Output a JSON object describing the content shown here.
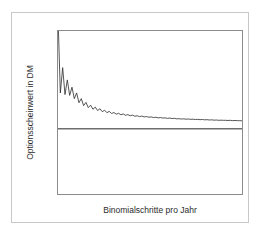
{
  "chart_data": {
    "type": "line",
    "title": "",
    "xlabel": "Binomialschritte pro Jahr",
    "ylabel": "Optionsscheinwert in DM",
    "xlim": [
      1,
      80
    ],
    "ylim": [
      24,
      34
    ],
    "grid": false,
    "legend": "none",
    "xticks": [
      1,
      10,
      20,
      30,
      40,
      50,
      60,
      70,
      80
    ],
    "yticks": [
      24,
      26,
      28,
      30,
      32,
      34
    ],
    "series": [
      {
        "name": "Binomialwert",
        "color": "#2b2b2b",
        "x": [
          1,
          2,
          3,
          4,
          5,
          6,
          7,
          8,
          9,
          10,
          11,
          12,
          13,
          14,
          15,
          16,
          17,
          18,
          19,
          20,
          21,
          22,
          23,
          24,
          25,
          26,
          27,
          28,
          29,
          30,
          31,
          32,
          33,
          34,
          35,
          36,
          37,
          38,
          39,
          40,
          41,
          42,
          43,
          44,
          45,
          46,
          47,
          48,
          49,
          50,
          51,
          52,
          53,
          54,
          55,
          56,
          57,
          58,
          59,
          60,
          61,
          62,
          63,
          64,
          65,
          66,
          67,
          68,
          69,
          70,
          71,
          72,
          73,
          74,
          75,
          76,
          77,
          78,
          79,
          80
        ],
        "values": [
          34.9,
          30.2,
          31.75,
          30.1,
          31.0,
          30.05,
          30.55,
          29.85,
          30.2,
          29.6,
          29.85,
          29.42,
          29.62,
          29.3,
          29.45,
          29.2,
          29.33,
          29.12,
          29.23,
          29.05,
          29.14,
          28.99,
          29.07,
          28.94,
          29.0,
          28.9,
          28.95,
          28.86,
          28.91,
          28.83,
          28.87,
          28.8,
          28.84,
          28.77,
          28.8,
          28.75,
          28.78,
          28.73,
          28.75,
          28.71,
          28.73,
          28.69,
          28.71,
          28.67,
          28.69,
          28.66,
          28.67,
          28.64,
          28.66,
          28.63,
          28.64,
          28.61,
          28.62,
          28.6,
          28.61,
          28.59,
          28.6,
          28.58,
          28.59,
          28.57,
          28.58,
          28.56,
          28.57,
          28.55,
          28.56,
          28.54,
          28.55,
          28.53,
          28.54,
          28.52,
          28.53,
          28.52,
          28.52,
          28.51,
          28.52,
          28.5,
          28.51,
          28.5,
          28.5,
          28.49
        ]
      }
    ],
    "reference_line": {
      "name": "Referenzwert",
      "value": 28,
      "orientation": "horizontal",
      "color": "#6e6e6e"
    }
  },
  "axis": {
    "y_ticklabels": [
      "34",
      "32",
      "30",
      "28",
      "26",
      "24"
    ],
    "x_ticklabels": [
      "1",
      "10",
      "20",
      "30",
      "40",
      "50",
      "60",
      "70",
      "80"
    ]
  }
}
